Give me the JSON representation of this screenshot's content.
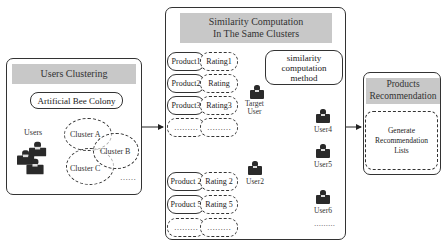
{
  "users_clustering": {
    "title": "Users Clustering",
    "algorithm": "Artificial Bee Colony",
    "users_label": "Users",
    "clusters": [
      "Cluster A",
      "Cluster B",
      "Cluster C"
    ],
    "more": "……"
  },
  "similarity": {
    "title_line1": "Similarity Computation",
    "title_line2": "In The Same Clusters",
    "method_line1": "similarity",
    "method_line2": "computation",
    "method_line3": "method",
    "top_rows": [
      {
        "product": "Product1",
        "rating": "Rating1"
      },
      {
        "product": "Product2",
        "rating": "Rating"
      },
      {
        "product": "Product3",
        "rating": "Rating3"
      },
      {
        "product": "………",
        "rating": "………"
      }
    ],
    "bottom_rows": [
      {
        "product": "Product 2",
        "rating": "Rating 2"
      },
      {
        "product": "Product 5",
        "rating": "Rating 5"
      },
      {
        "product": "………",
        "rating": "………"
      }
    ],
    "target_user_line1": "Target",
    "target_user_line2": "User",
    "users": [
      "User2",
      "User4",
      "User5",
      "User6"
    ],
    "more": "………"
  },
  "recommendation": {
    "title_line1": "Products",
    "title_line2": "Recommendation",
    "body_line1": "Generate",
    "body_line2": "Recommendation",
    "body_line3": "Lists"
  }
}
